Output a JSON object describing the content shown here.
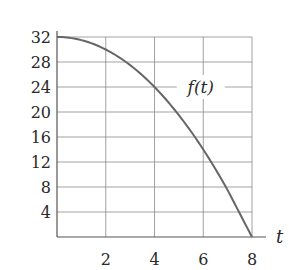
{
  "chart_data": {
    "type": "line",
    "title": "",
    "xlabel": "t",
    "ylabel": "",
    "xlim": [
      0,
      8
    ],
    "ylim": [
      0,
      32
    ],
    "x_ticks": [
      2,
      4,
      6,
      8
    ],
    "y_ticks": [
      4,
      8,
      12,
      16,
      20,
      24,
      28,
      32
    ],
    "grid": true,
    "legend": null,
    "series": [
      {
        "name": "f(t)",
        "x": [
          0,
          1,
          2,
          3,
          4,
          5,
          6,
          7,
          8
        ],
        "values": [
          32,
          31.5,
          30,
          27.5,
          24,
          19.5,
          14,
          7.5,
          0
        ]
      }
    ],
    "annotations": [
      {
        "text": "f(t)",
        "x": 5.9,
        "y": 24
      }
    ]
  },
  "colors": {
    "grid": "#8a8a8a",
    "axis": "#555555",
    "curve": "#666666",
    "text": "#2a2a2a"
  }
}
